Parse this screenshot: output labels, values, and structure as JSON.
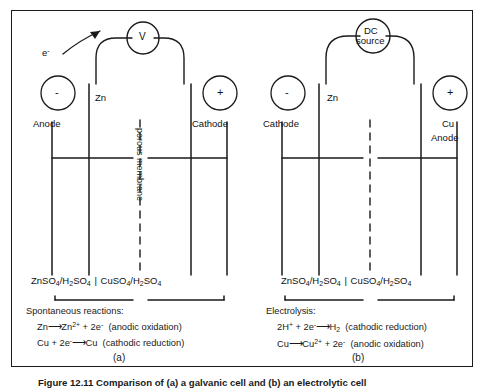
{
  "figure": {
    "caption": "Figure 12.11  Comparison of (a) a galvanic cell and (b) an electrolytic cell",
    "border_color": "#1a1a1a",
    "line_color": "#1a1a1a",
    "background": "#ffffff"
  },
  "panels": [
    {
      "id": "a",
      "tag": "(a)",
      "source": {
        "label_line1": "V",
        "label_line2": "",
        "type": "voltmeter"
      },
      "electron_label": "e",
      "electron_charge": "-",
      "left_terminal": {
        "sign": "-",
        "name": "Anode"
      },
      "right_terminal": {
        "sign": "+",
        "name": "Cathode"
      },
      "electrode_label": "Zn",
      "membrane_label": "porous membrane",
      "electrolyte": {
        "left": {
          "salt": "ZnSO",
          "salt_sub": "4",
          "sep": "/",
          "acid": "H",
          "acid_sub1": "2",
          "acid2": "SO",
          "acid_sub2": "4"
        },
        "right": {
          "salt": "CuSO",
          "salt_sub": "4",
          "sep": "/",
          "acid": "H",
          "acid_sub1": "2",
          "acid2": "SO",
          "acid_sub2": "4"
        },
        "text": "ZnSO4/H2SO4 | CuSO4/H2SO4"
      },
      "reactions": {
        "heading": "Spontaneous reactions:",
        "lines": [
          {
            "left": "Zn",
            "arrow": "→",
            "product": "Zn",
            "product_sup": "2+",
            "plus": " + 2e",
            "plus_sup": "-",
            "note": "(anodic oxidation)"
          },
          {
            "left": "Cu + 2e",
            "left_sup": "-",
            "arrow": "→",
            "product": "Cu",
            "product_sup": "",
            "plus": "",
            "plus_sup": "",
            "note": "(cathodic reduction)"
          }
        ]
      }
    },
    {
      "id": "b",
      "tag": "(b)",
      "source": {
        "label_line1": "DC",
        "label_line2": "source",
        "type": "dc-source"
      },
      "electron_label": "",
      "electron_charge": "",
      "left_terminal": {
        "sign": "-",
        "name": "Cathode"
      },
      "right_terminal": {
        "sign": "+",
        "name": "Anode"
      },
      "electrode_label": "Zn",
      "right_electrode_label": "Cu",
      "membrane_label": "",
      "electrolyte": {
        "left": {
          "salt": "ZnSO",
          "salt_sub": "4",
          "sep": "/",
          "acid": "H",
          "acid_sub1": "2",
          "acid2": "SO",
          "acid_sub2": "4"
        },
        "right": {
          "salt": "CuSO",
          "salt_sub": "4",
          "sep": "/",
          "acid": "H",
          "acid_sub1": "2",
          "acid2": "SO",
          "acid_sub2": "4"
        },
        "text": "ZnSO4/H2SO4 | CuSO4/H2SO4"
      },
      "reactions": {
        "heading": "Electrolysis:",
        "lines": [
          {
            "left": "2H",
            "left_sup": "+",
            "mid": " + 2e",
            "mid_sup": "-",
            "arrow": "→",
            "product": "H",
            "product_sub": "2",
            "note": "(cathodic reduction)"
          },
          {
            "left": "Cu",
            "left_sup": "",
            "mid": "",
            "mid_sup": "",
            "arrow": "→",
            "product": "Cu",
            "product_sup": "2+",
            "plus": " + 2e",
            "plus_sup": "-",
            "note": "(anodic oxidation)"
          }
        ]
      }
    }
  ]
}
